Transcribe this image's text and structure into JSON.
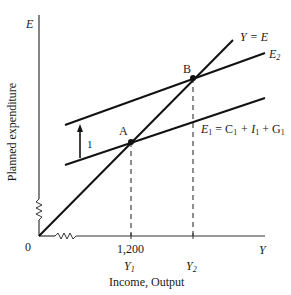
{
  "diagram": {
    "type": "keynesian-cross",
    "axes": {
      "y_axis_symbol": "E",
      "x_axis_symbol": "Y",
      "y_axis_label": "Planned expenditure",
      "x_axis_label": "Income, Output",
      "origin_label": "0",
      "axis_breaks": true
    },
    "lines": [
      {
        "id": "45-degree",
        "label": "Y = E"
      },
      {
        "id": "E2",
        "label_main": "E",
        "label_sub": "2"
      },
      {
        "id": "E1",
        "label_main": "E",
        "label_sub": "1",
        "label_rest": " = C",
        "label_c_sub": "1",
        "label_plus_i": " + I",
        "label_i_sub": "1",
        "label_plus_g": " + G",
        "label_g_sub": "1"
      }
    ],
    "points": [
      {
        "id": "A",
        "label": "A",
        "description": "Intersection of E1 and Y = E"
      },
      {
        "id": "B",
        "label": "B",
        "description": "Intersection of E2 and Y = E"
      }
    ],
    "shift": {
      "arrow_label": "1",
      "direction": "up",
      "description": "Upward shift from E1 to E2"
    },
    "x_ticks": [
      {
        "value_label": "1,200",
        "symbol_main": "Y",
        "symbol_sub": "1"
      },
      {
        "value_label": "",
        "symbol_main": "Y",
        "symbol_sub": "2"
      }
    ]
  },
  "colors": {
    "ink": "#1a1a1a",
    "axis": "#333333",
    "background": "#ffffff"
  }
}
